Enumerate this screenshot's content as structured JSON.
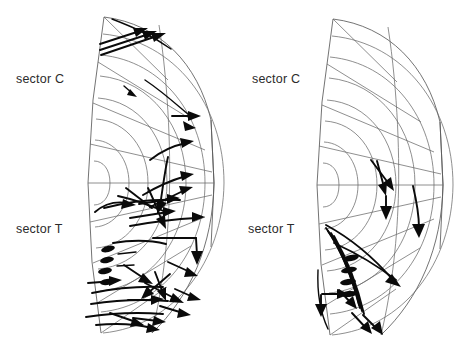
{
  "figure": {
    "width": 465,
    "height": 350,
    "background_color": "#ffffff",
    "grid_color": "#5a5a5a",
    "vector_color": "#0a0a0a",
    "label_color": "#2b2b2b"
  },
  "panels": [
    {
      "id": "left-panel",
      "name": "left",
      "labels": {
        "upper": "sector C",
        "lower": "sector T"
      },
      "geometry": {
        "center_x": 78,
        "center_y": 183,
        "radii": [
          22,
          40,
          58,
          76,
          95,
          114,
          133,
          139
        ],
        "angle_start_deg": -72,
        "angle_end_deg": 72,
        "radial_line_count": 9
      },
      "vector_count": 46,
      "density": "high"
    },
    {
      "id": "right-panel",
      "name": "right",
      "labels": {
        "upper": "sector C",
        "lower": "sector T"
      },
      "geometry": {
        "center_x": 307,
        "center_y": 185,
        "radii": [
          22,
          40,
          58,
          76,
          95,
          114,
          133,
          139
        ],
        "angle_start_deg": -72,
        "angle_end_deg": 72,
        "radial_line_count": 9
      },
      "vector_count": 17,
      "density": "low"
    }
  ],
  "legend_text": {
    "sector_c": "sector C",
    "sector_t": "sector T"
  }
}
